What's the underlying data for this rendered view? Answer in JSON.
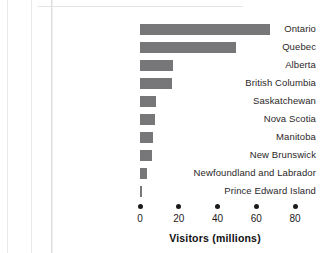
{
  "chart_data": {
    "type": "bar",
    "orientation": "horizontal",
    "title": "",
    "xlabel": "Visitors (millions)",
    "ylabel": "",
    "categories": [
      "Ontario",
      "Quebec",
      "Alberta",
      "British Columbia",
      "Saskatchewan",
      "Nova Scotia",
      "Manitoba",
      "New Brunswick",
      "Newfoundland and Labrador",
      "Prince Edward Island"
    ],
    "values": [
      67,
      49.5,
      17,
      16.5,
      8,
      7.5,
      6.5,
      6,
      3.5,
      1
    ],
    "xticks": [
      0,
      20,
      40,
      60,
      80
    ],
    "xticklabels": [
      "0",
      "20",
      "40",
      "60",
      "80"
    ],
    "xlim": [
      0,
      80
    ],
    "grid": false,
    "legend": null,
    "bar_color": "#777779",
    "tick_marker": "dot"
  },
  "axis": {
    "title": "Visitors (millions)"
  }
}
